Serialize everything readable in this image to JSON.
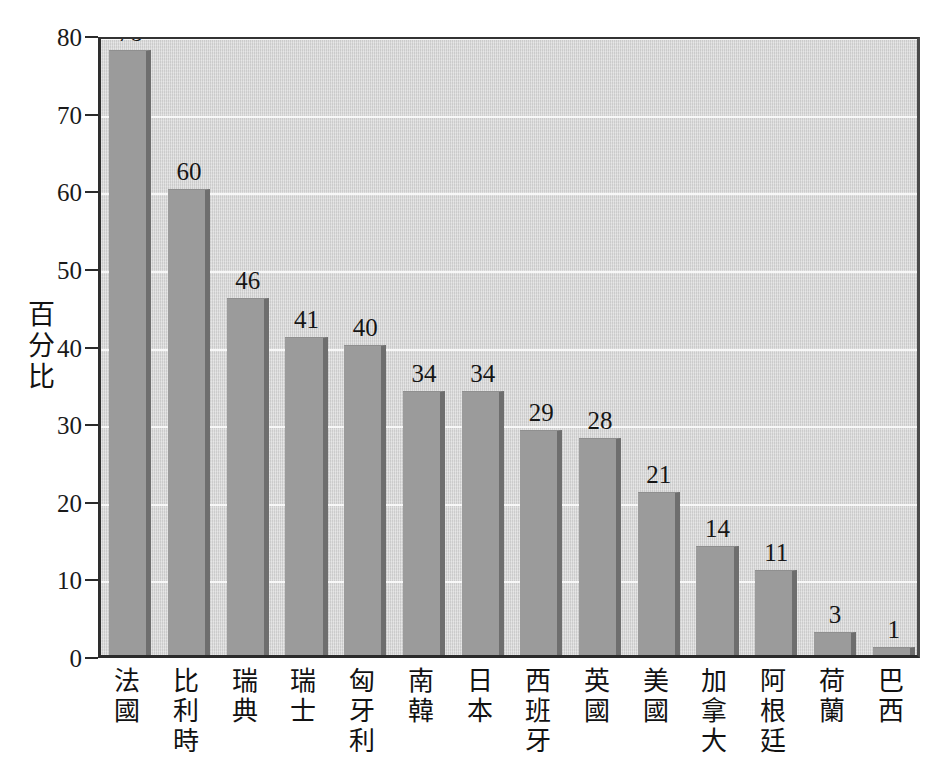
{
  "chart_data": {
    "type": "bar",
    "title": "",
    "subtitle": "",
    "xlabel": "",
    "ylabel": "百分比",
    "ylim": [
      0,
      80
    ],
    "ytick_values": [
      0,
      10,
      20,
      30,
      40,
      50,
      60,
      70,
      80
    ],
    "ytick_labels": [
      "0",
      "10",
      "20",
      "30",
      "40",
      "50",
      "60",
      "70",
      "80"
    ],
    "grid": "horizontal",
    "legend": "none",
    "categories": [
      "法\n國",
      "比\n利\n時",
      "瑞\n典",
      "瑞\n士",
      "匈\n牙\n利",
      "南\n韓",
      "日\n本",
      "西\n班\n牙",
      "英\n國",
      "美\n國",
      "加\n拿\n大",
      "阿\n根\n廷",
      "荷\n蘭",
      "巴\n西"
    ],
    "categories_flat": [
      "法國",
      "比利時",
      "瑞典",
      "瑞士",
      "匈牙利",
      "南韓",
      "日本",
      "西班牙",
      "英國",
      "美國",
      "加拿大",
      "阿根廷",
      "荷蘭",
      "巴西"
    ],
    "values": [
      78,
      60,
      46,
      41,
      40,
      34,
      34,
      29,
      28,
      21,
      14,
      11,
      3,
      1
    ],
    "value_labels": [
      "78",
      "60",
      "46",
      "41",
      "40",
      "34",
      "34",
      "29",
      "28",
      "21",
      "14",
      "11",
      "3",
      "1"
    ],
    "colors": {
      "bar_fill": "#9b9b9b",
      "bar_shadow": "#6e6e6e",
      "plot_background": "#d6d6d6",
      "gridline": "#fafafa",
      "axis": "#2b2b2b",
      "text": "#161616",
      "page_background": "#ffffff"
    }
  }
}
